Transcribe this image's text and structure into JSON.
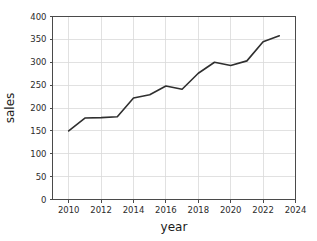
{
  "chart_data": {
    "type": "line",
    "title": "",
    "xlabel": "year",
    "ylabel": "sales",
    "x": [
      2010,
      2011,
      2012,
      2013,
      2014,
      2015,
      2016,
      2017,
      2018,
      2019,
      2020,
      2021,
      2022,
      2023
    ],
    "values": [
      150,
      178,
      179,
      181,
      222,
      229,
      248,
      241,
      276,
      300,
      293,
      303,
      345,
      358
    ],
    "series": [
      {
        "name": "sales",
        "values": [
          150,
          178,
          179,
          181,
          222,
          229,
          248,
          241,
          276,
          300,
          293,
          303,
          345,
          358
        ]
      }
    ],
    "xlim": [
      2009,
      2024
    ],
    "ylim": [
      0,
      400
    ],
    "xticks": [
      2010,
      2012,
      2014,
      2016,
      2018,
      2020,
      2022,
      2024
    ],
    "xtick_labels": [
      "2010",
      "2012",
      "2014",
      "2016",
      "2018",
      "2020",
      "2022",
      "2024"
    ],
    "yticks": [
      0,
      50,
      100,
      150,
      200,
      250,
      300,
      350,
      400
    ],
    "ytick_labels": [
      "0",
      "50",
      "100",
      "150",
      "200",
      "250",
      "300",
      "350",
      "400"
    ],
    "grid": true,
    "legend": false,
    "legend_position": "none",
    "line_color": "#2f2f2f",
    "grid_color": "#d9d9d9",
    "background_color": "#ffffff"
  }
}
